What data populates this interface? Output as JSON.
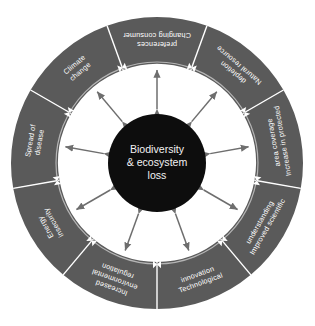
{
  "diagram": {
    "type": "circular-driver-wheel",
    "center": {
      "label_lines": [
        "Biodiversity",
        "& ecosystem",
        "loss"
      ],
      "full_label": "Biodiversity & ecosystem loss",
      "fill_color": "#0d0d0d",
      "text_color": "#f2f2f2"
    },
    "ring": {
      "fill_color": "#5a5a5a",
      "divider_color": "#ffffff",
      "inner_guide_color": "#b5b5b5",
      "outer_radius": 146,
      "inner_radius": 99,
      "center_circle_radius": 49,
      "segment_count": 9
    },
    "arrows": {
      "color": "#6e6e6e",
      "style": "double-headed",
      "count": 9,
      "description": "Double-headed arrows radiate between the central circle and the inner edge of the ring"
    },
    "segments": [
      {
        "index": 0,
        "name": "natural-resource-depletion",
        "label_lines": [
          "Natural resource",
          "depletion"
        ],
        "full_label": "Natural resource depletion",
        "start_angle": -70,
        "end_angle": -30
      },
      {
        "index": 1,
        "name": "increase-in-protected-area-coverage",
        "label_lines": [
          "Increase in protected",
          "area coverage"
        ],
        "full_label": "Increase in protected area coverage",
        "start_angle": -30,
        "end_angle": 10
      },
      {
        "index": 2,
        "name": "improved-scientific-understanding",
        "label_lines": [
          "Improved scientific",
          "understanding"
        ],
        "full_label": "Improved scientific understanding",
        "start_angle": 10,
        "end_angle": 50
      },
      {
        "index": 3,
        "name": "technological-innovation",
        "label_lines": [
          "Technological",
          "innovation"
        ],
        "full_label": "Technological innovation",
        "start_angle": 50,
        "end_angle": 90
      },
      {
        "index": 4,
        "name": "increased-environmental-regulation",
        "label_lines": [
          "Increased",
          "environmental",
          "regulation"
        ],
        "full_label": "Increased environmental regulation",
        "start_angle": 90,
        "end_angle": 130
      },
      {
        "index": 5,
        "name": "energy-insecurity",
        "label_lines": [
          "Energy",
          "insecurity"
        ],
        "full_label": "Energy insecurity",
        "start_angle": 130,
        "end_angle": 170
      },
      {
        "index": 6,
        "name": "spread-of-disease",
        "label_lines": [
          "Spread of",
          "disease"
        ],
        "full_label": "Spread of disease",
        "start_angle": 170,
        "end_angle": 210
      },
      {
        "index": 7,
        "name": "climate-change",
        "label_lines": [
          "Climate",
          "change"
        ],
        "full_label": "Climate change",
        "start_angle": 210,
        "end_angle": 250
      },
      {
        "index": 8,
        "name": "changing-consumer-preferences",
        "label_lines": [
          "Changing consumer",
          "preferences"
        ],
        "full_label": "Changing consumer preferences",
        "start_angle": 250,
        "end_angle": 290
      }
    ]
  }
}
